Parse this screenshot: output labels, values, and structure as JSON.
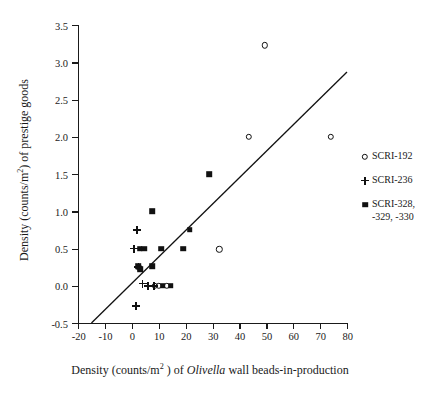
{
  "chart_data": {
    "type": "scatter",
    "title": "",
    "xlabel": "Density (counts/m²) of Olivella wall beads-in-production",
    "ylabel": "Density (counts/m²) of prestige goods",
    "xlim": [
      -20,
      80
    ],
    "ylim": [
      -0.5,
      3.5
    ],
    "grid": false,
    "legend_position": "right",
    "xticks": [
      "-20",
      "-10",
      "0",
      "10",
      "20",
      "30",
      "40",
      "50",
      "60",
      "70",
      "80"
    ],
    "xtick_values": [
      -20,
      -10,
      0,
      10,
      20,
      30,
      40,
      50,
      60,
      70,
      80
    ],
    "yticks": [
      "3.5",
      "3.0",
      "2.5",
      "2.0",
      "1.5",
      "1.0",
      "0.5",
      "0.0",
      "-0.5"
    ],
    "ytick_values": [
      3.5,
      3.0,
      2.5,
      2.0,
      1.5,
      1.0,
      0.5,
      0.0,
      -0.5
    ],
    "series": [
      {
        "name": "SCRI-192",
        "marker": "open-circle",
        "points": [
          {
            "x": 49.5,
            "y": 3.23
          },
          {
            "x": 43.5,
            "y": 2.0
          },
          {
            "x": 74.0,
            "y": 2.0
          },
          {
            "x": 32.5,
            "y": 0.49
          },
          {
            "x": 10.0,
            "y": 0.0
          },
          {
            "x": 13.0,
            "y": 0.0
          },
          {
            "x": 8.5,
            "y": 0.0
          },
          {
            "x": 2.6,
            "y": 0.25
          }
        ]
      },
      {
        "name": "SCRI-236",
        "marker": "plus",
        "points": [
          {
            "x": 2.0,
            "y": 0.75
          },
          {
            "x": 0.8,
            "y": 0.5
          },
          {
            "x": 2.4,
            "y": 0.25
          },
          {
            "x": 4.0,
            "y": 0.03
          },
          {
            "x": 6.0,
            "y": 0.0
          },
          {
            "x": 8.3,
            "y": 0.0
          },
          {
            "x": 1.5,
            "y": -0.27
          }
        ]
      },
      {
        "name": "SCRI-328,\n-329, -330",
        "marker": "filled-square",
        "points": [
          {
            "x": 28.8,
            "y": 1.5
          },
          {
            "x": 7.5,
            "y": 1.0
          },
          {
            "x": 21.5,
            "y": 0.75
          },
          {
            "x": 2.9,
            "y": 0.5
          },
          {
            "x": 4.6,
            "y": 0.5
          },
          {
            "x": 11.0,
            "y": 0.5
          },
          {
            "x": 19.0,
            "y": 0.5
          },
          {
            "x": 2.3,
            "y": 0.26
          },
          {
            "x": 3.1,
            "y": 0.22
          },
          {
            "x": 7.5,
            "y": 0.26
          },
          {
            "x": 11.5,
            "y": 0.0
          },
          {
            "x": 14.5,
            "y": 0.0
          }
        ]
      }
    ],
    "trendline": {
      "x1": -15.0,
      "y1": -0.5,
      "x2": 80.0,
      "y2": 2.87
    }
  },
  "legend": {
    "entries": [
      {
        "label": "SCRI-192",
        "marker": "open-circle"
      },
      {
        "label": "SCRI-236",
        "marker": "plus"
      },
      {
        "label": "SCRI-328,\n-329, -330",
        "marker": "filled-square"
      }
    ]
  },
  "axis_titles": {
    "y_prefix": "Density (counts/m",
    "y_sup": "2",
    "y_suffix": ") of prestige goods",
    "x_prefix": "Density (counts/m",
    "x_sup": "2",
    "x_mid": " ) of ",
    "x_italic": "Olivella",
    "x_suffix": " wall beads-in-production"
  }
}
